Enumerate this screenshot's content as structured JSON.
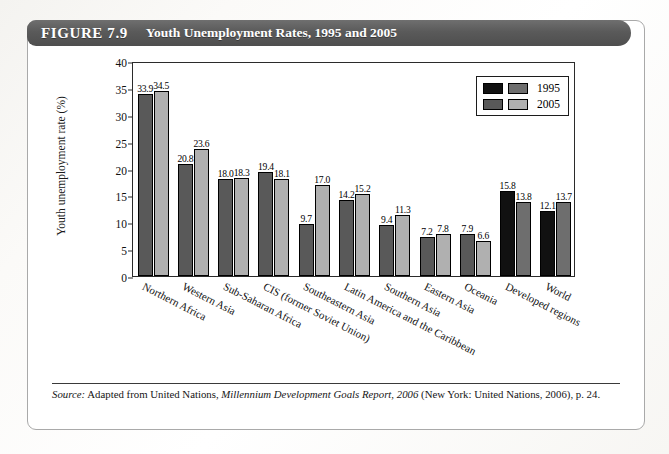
{
  "figure": {
    "number": "FIGURE 7.9",
    "title": "Youth Unemployment Rates, 1995 and 2005"
  },
  "source_note": {
    "label": "Source:",
    "text_before_italic": " Adapted from United Nations, ",
    "italic_title": "Millennium Development Goals Report, 2006",
    "text_after_italic": " (New York: United Nations, 2006), p. 24."
  },
  "chart_data": {
    "type": "bar",
    "title": "Youth Unemployment Rates, 1995 and 2005",
    "xlabel": "",
    "ylabel": "Youth unemployment rate (%)",
    "ylim": [
      0,
      40
    ],
    "yticks": [
      0,
      5,
      10,
      15,
      20,
      25,
      30,
      35,
      40
    ],
    "grid": false,
    "legend_position": "top-right",
    "categories": [
      "Northern Africa",
      "Western Asia",
      "Sub-Saharan Africa",
      "CIS (former Soviet Union)",
      "Southeastern Asia",
      "Latin America and the Caribbean",
      "Southern Asia",
      "Eastern Asia",
      "Oceania",
      "Developed regions",
      "World"
    ],
    "series": [
      {
        "name": "1995",
        "values": [
          33.9,
          20.8,
          18.0,
          19.4,
          9.7,
          14.2,
          9.4,
          7.2,
          7.9,
          15.8,
          12.1
        ]
      },
      {
        "name": "2005",
        "values": [
          34.5,
          23.6,
          18.3,
          18.1,
          17.0,
          15.2,
          11.3,
          7.8,
          6.6,
          13.8,
          13.7
        ]
      }
    ],
    "colors": {
      "series_1995_regional": "#595959",
      "series_2005_regional": "#b0b0b0",
      "series_1995_aggregate": "#111111",
      "series_2005_aggregate": "#6e6e6e",
      "bar_outline": "#000000",
      "banner": "#5a5a5a"
    },
    "aggregate_categories": [
      "Developed regions",
      "World"
    ],
    "legend": [
      {
        "label": "1995",
        "swatches": [
          "#111111",
          "#6e6e6e"
        ]
      },
      {
        "label": "2005",
        "swatches": [
          "#595959",
          "#b0b0b0"
        ]
      }
    ]
  }
}
